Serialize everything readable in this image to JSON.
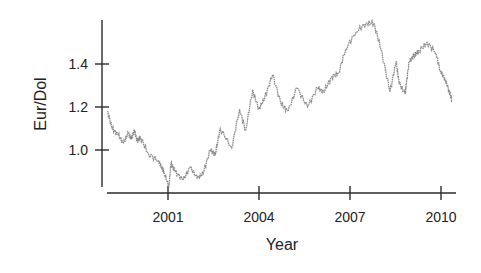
{
  "chart_data": {
    "type": "line",
    "title": "",
    "xlabel": "Year",
    "ylabel": "Eur/Dol",
    "xlim": [
      1999.0,
      2010.5
    ],
    "ylim": [
      0.82,
      1.6
    ],
    "grid": false,
    "legend": null,
    "x_ticks": [
      2001,
      2004,
      2007,
      2010
    ],
    "x_tick_labels": [
      "2001",
      "2004",
      "2007",
      "2010"
    ],
    "y_ticks": [
      1.0,
      1.2,
      1.4
    ],
    "y_tick_labels": [
      "1.0",
      "1.2",
      "1.4"
    ],
    "series": [
      {
        "name": "Eur/Dol",
        "color": "#8c8c8c",
        "x": [
          1999.0,
          1999.16,
          1999.36,
          1999.53,
          1999.69,
          1999.79,
          1999.89,
          1999.99,
          2000.09,
          2000.36,
          2000.69,
          2000.79,
          2000.86,
          2001.03,
          2001.1,
          2001.23,
          2001.5,
          2001.73,
          2001.96,
          2002.16,
          2002.39,
          2002.56,
          2002.72,
          2003.1,
          2003.36,
          2003.56,
          2003.79,
          2003.99,
          2004.18,
          2004.45,
          2004.74,
          2004.96,
          2005.25,
          2005.6,
          2005.93,
          2006.13,
          2006.4,
          2006.63,
          2006.86,
          2007.2,
          2007.53,
          2007.79,
          2008.02,
          2008.32,
          2008.52,
          2008.62,
          2008.82,
          2008.85,
          2008.95,
          2009.11,
          2009.28,
          2009.54,
          2009.84,
          2009.97,
          2010.13,
          2010.26,
          2010.36
        ],
        "values": [
          1.18,
          1.1,
          1.07,
          1.03,
          1.08,
          1.05,
          1.09,
          1.04,
          1.06,
          0.98,
          0.95,
          0.92,
          0.9,
          0.83,
          0.94,
          0.9,
          0.86,
          0.92,
          0.87,
          0.89,
          1.0,
          0.98,
          1.1,
          1.01,
          1.19,
          1.09,
          1.28,
          1.19,
          1.24,
          1.35,
          1.21,
          1.18,
          1.29,
          1.2,
          1.29,
          1.27,
          1.34,
          1.36,
          1.47,
          1.55,
          1.59,
          1.59,
          1.47,
          1.27,
          1.41,
          1.31,
          1.26,
          1.3,
          1.41,
          1.44,
          1.46,
          1.5,
          1.45,
          1.37,
          1.33,
          1.28,
          1.23
        ]
      }
    ]
  }
}
